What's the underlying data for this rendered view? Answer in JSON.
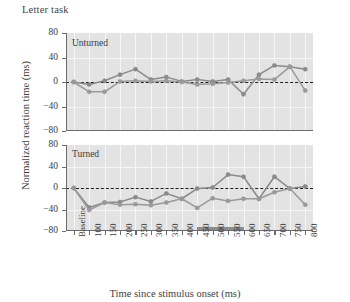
{
  "figure": {
    "title": "Letter task",
    "xlabel": "Time since stimulus onset (ms)",
    "ylabel": "Normalized reaction time (ms)"
  },
  "panels": {
    "unturned_tag": "Unturned",
    "turned_tag": "Turned"
  },
  "yticks": [
    "80",
    "40",
    "0",
    "−40",
    "−80"
  ],
  "xticks": [
    "Baseline",
    "100",
    "150",
    "200",
    "250",
    "300",
    "350",
    "400",
    "450",
    "500",
    "550",
    "600",
    "650",
    "700",
    "750",
    "800"
  ],
  "colors": {
    "series_a": "#8a8a8a",
    "series_b": "#9a9a9a",
    "plot_bg": "#e3e3e3",
    "grid": "#f6f6f6",
    "axis": "#6b6b6b",
    "zero_line": "#1d1d1d",
    "sig_bar": "#8c8c8c",
    "text": "#3a3a3a"
  },
  "chart_data": {
    "type": "line",
    "title": "Letter task",
    "xlabel": "Time since stimulus onset (ms)",
    "ylabel": "Normalized reaction time (ms)",
    "ylim": [
      -80,
      80
    ],
    "ytick_values": [
      80,
      40,
      0,
      -40,
      -80
    ],
    "grid": true,
    "legend": "none",
    "categories": [
      "Baseline",
      "100",
      "150",
      "200",
      "250",
      "300",
      "350",
      "400",
      "450",
      "500",
      "550",
      "600",
      "650",
      "700",
      "750",
      "800"
    ],
    "panels": [
      {
        "name": "Unturned",
        "zero_reference_line": 0,
        "significance_bar": null,
        "series": [
          {
            "name": "series-a",
            "color": "#8a8a8a",
            "values": [
              0,
              -4,
              2,
              12,
              21,
              4,
              8,
              1,
              4,
              1,
              4,
              -20,
              12,
              27,
              25,
              21
            ]
          },
          {
            "name": "series-b",
            "color": "#9a9a9a",
            "values": [
              0,
              -16,
              -16,
              1,
              2,
              1,
              2,
              0,
              -4,
              -3,
              -1,
              2,
              5,
              4,
              25,
              -14
            ]
          }
        ]
      },
      {
        "name": "Turned",
        "zero_reference_line": 0,
        "significance_bar": {
          "start": "450",
          "end": "600",
          "label": "significant interval"
        },
        "series": [
          {
            "name": "series-a",
            "color": "#8a8a8a",
            "values": [
              0,
              -36,
              -27,
              -26,
              -17,
              -25,
              -10,
              -20,
              -1,
              1,
              25,
              21,
              -20,
              21,
              -1,
              3
            ]
          },
          {
            "name": "series-b",
            "color": "#9a9a9a",
            "values": [
              0,
              -41,
              -27,
              -31,
              -30,
              -32,
              -27,
              -20,
              -37,
              -19,
              -24,
              -20,
              -20,
              -8,
              -1,
              -31
            ]
          }
        ]
      }
    ]
  }
}
